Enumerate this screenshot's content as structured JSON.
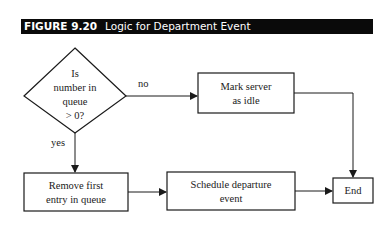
{
  "figure": {
    "number": "FIGURE 9.20",
    "title": "Logic for Department Event"
  },
  "nodes": {
    "decision": {
      "lines": [
        "Is",
        "number in",
        "queue",
        "> 0?"
      ]
    },
    "mark_idle": {
      "lines": [
        "Mark server",
        "as idle"
      ]
    },
    "remove_first": {
      "lines": [
        "Remove first",
        "entry in queue"
      ]
    },
    "schedule_departure": {
      "lines": [
        "Schedule departure",
        "event"
      ]
    },
    "end": {
      "lines": [
        "End"
      ]
    }
  },
  "edges": {
    "no_label": "no",
    "yes_label": "yes"
  },
  "colors": {
    "header_bg": "#0a0a0a",
    "header_text": "#ffffff",
    "stroke": "#1a1a1a"
  }
}
